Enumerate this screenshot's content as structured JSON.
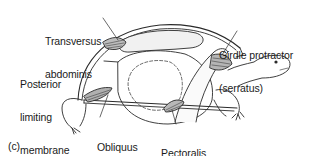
{
  "figure": {
    "panel_label": "(c)",
    "labels": {
      "transversus": {
        "line1": "Transversus",
        "line2": "abdominis"
      },
      "girdle": {
        "line1": "Girdle protractor",
        "line2": "(serratus)"
      },
      "posterior": {
        "line1": "Posterior",
        "line2": "limiting",
        "line3": "membrane"
      },
      "obliquus": {
        "line1": "Obliquus",
        "line2": "abdominis"
      },
      "pectoralis": {
        "line1": "Pectoralis"
      }
    }
  }
}
